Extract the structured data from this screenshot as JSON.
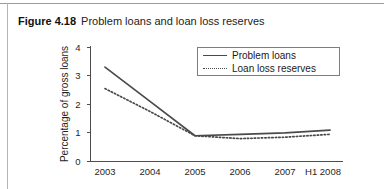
{
  "figure": {
    "label": "Figure 4.18",
    "title": "Problem loans and loan loss reserves"
  },
  "legend": {
    "position": "top-right",
    "entries": [
      {
        "label": "Problem loans",
        "style": "solid"
      },
      {
        "label": "Loan loss reserves",
        "style": "dotted"
      }
    ]
  },
  "axes": {
    "y_label": "Percentage of gross loans",
    "y_ticks": [
      "0",
      "1",
      "2",
      "3",
      "4"
    ],
    "x_ticks": [
      "2003",
      "2004",
      "2005",
      "2006",
      "2007",
      "H1 2008"
    ]
  },
  "chart_data": {
    "type": "line",
    "title": "Problem loans and loan loss reserves",
    "xlabel": "",
    "ylabel": "Percentage of gross loans",
    "categories": [
      "2003",
      "2004",
      "2005",
      "2006",
      "2007",
      "H1 2008"
    ],
    "series": [
      {
        "name": "Problem loans",
        "style": "solid",
        "values": [
          3.3,
          2.1,
          0.9,
          0.95,
          1.0,
          1.1
        ]
      },
      {
        "name": "Loan loss reserves",
        "style": "dotted",
        "values": [
          2.55,
          1.75,
          0.9,
          0.8,
          0.85,
          0.95
        ]
      }
    ],
    "ylim": [
      0,
      4
    ],
    "grid": false,
    "legend_position": "top-right"
  }
}
